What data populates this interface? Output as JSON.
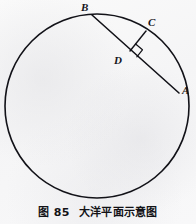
{
  "figure": {
    "caption_number": "图 85",
    "caption_title": "大洋平面示意图",
    "background_color": "#fbfbfb",
    "ink_color": "#121218"
  },
  "diagram": {
    "type": "geometry-circle-chord",
    "circle": {
      "name": "ocean-circle",
      "center_x": 97,
      "center_y": 106,
      "radius": 92,
      "stroke_width": 1.6
    },
    "points": [
      {
        "id": "B",
        "label": "B",
        "x": 92,
        "y": 15,
        "on": "circle",
        "label_x": 81,
        "label_y": 2
      },
      {
        "id": "C",
        "label": "C",
        "x": 146,
        "y": 31,
        "on": "circle",
        "label_x": 148,
        "label_y": 17
      },
      {
        "id": "D",
        "label": "D",
        "x": 130,
        "y": 51,
        "on": "chord-BA",
        "label_x": 114,
        "label_y": 55
      },
      {
        "id": "A",
        "label": "A",
        "x": 179,
        "y": 93,
        "on": "circle",
        "label_x": 182,
        "label_y": 85
      }
    ],
    "segments": [
      {
        "id": "chord-BA",
        "from": "B",
        "to": "A",
        "stroke_width": 1.6
      },
      {
        "id": "segment-CD",
        "from": "C",
        "to": "D",
        "stroke_width": 1.4
      }
    ],
    "right_angle": {
      "id": "right-angle-at-D",
      "at": "D",
      "size": 9,
      "stroke_width": 1.2
    }
  }
}
